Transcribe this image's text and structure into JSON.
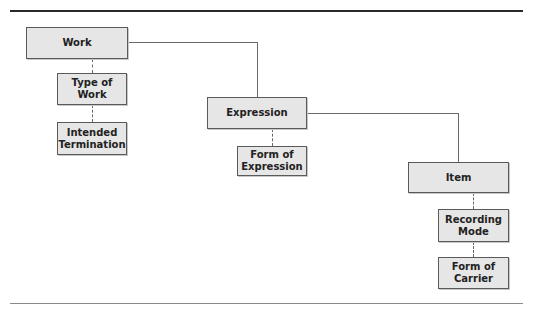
{
  "diagram": {
    "nodes": {
      "work": {
        "label": "Work"
      },
      "type_of_work": {
        "label": "Type of Work"
      },
      "intended_termination": {
        "label": "Intended\nTermination"
      },
      "expression": {
        "label": "Expression"
      },
      "form_of_expression": {
        "label": "Form of\nExpression"
      },
      "item": {
        "label": "Item"
      },
      "recording_mode": {
        "label": "Recording\nMode"
      },
      "form_of_carrier": {
        "label": "Form of\nCarrier"
      }
    },
    "edges": [
      {
        "from": "Work",
        "to": "Expression",
        "style": "solid"
      },
      {
        "from": "Expression",
        "to": "Item",
        "style": "solid"
      },
      {
        "from": "Work",
        "to": "Type of Work",
        "style": "dashed"
      },
      {
        "from": "Type of Work",
        "to": "Intended Termination",
        "style": "dashed"
      },
      {
        "from": "Expression",
        "to": "Form of Expression",
        "style": "dashed"
      },
      {
        "from": "Item",
        "to": "Recording Mode",
        "style": "dashed"
      },
      {
        "from": "Recording Mode",
        "to": "Form of Carrier",
        "style": "dashed"
      }
    ],
    "colors": {
      "box_fill": "#e6e6e6",
      "box_border": "#5a5a5a",
      "line": "#6a6a6a"
    }
  }
}
